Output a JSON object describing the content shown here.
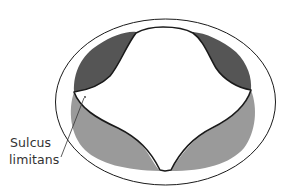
{
  "figure": {
    "type": "neural-tube-cross-section",
    "colors": {
      "background": "#ffffff",
      "outline": "#1a1a1a",
      "alar_plate": "#555555",
      "basal_plate": "#999999",
      "canal": "#ffffff"
    },
    "regions": [
      {
        "name": "left-alar-plate",
        "shade": "dark"
      },
      {
        "name": "right-alar-plate",
        "shade": "dark"
      },
      {
        "name": "left-basal-plate",
        "shade": "light"
      },
      {
        "name": "right-basal-plate",
        "shade": "light"
      },
      {
        "name": "central-canal",
        "shade": "white"
      }
    ]
  },
  "labels": {
    "sulcus_limitans_line1": "Sulcus",
    "sulcus_limitans_line2": "limitans"
  }
}
